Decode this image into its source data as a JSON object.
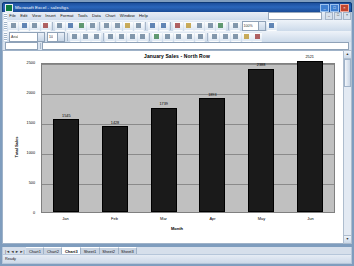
{
  "window": {
    "title": "Microsoft Excel - salesfigs",
    "icon": "excel-icon",
    "buttons": {
      "minimize": "_",
      "maximize": "□",
      "close": "×"
    }
  },
  "menu": {
    "items": [
      "File",
      "Edit",
      "View",
      "Insert",
      "Format",
      "Tools",
      "Data",
      "Chart",
      "Window",
      "Help"
    ],
    "question_placeholder": "Type a question for help"
  },
  "formula_bar": {
    "name_box": "",
    "formula": ""
  },
  "chart_data": {
    "type": "bar",
    "title": "January Sales - North Row",
    "xlabel": "Month",
    "ylabel": "Total Sales",
    "categories": [
      "Jan",
      "Feb",
      "Mar",
      "Apr",
      "May",
      "Jun"
    ],
    "values": [
      1545,
      1428,
      1739,
      1893,
      2388,
      2521
    ],
    "labels": [
      "1545",
      "1428",
      "1739",
      "1893",
      "2388",
      "2521"
    ],
    "yticks": [
      0,
      500,
      1000,
      1500,
      2000,
      2500
    ],
    "ytick_labels": [
      "0",
      "500",
      "1000",
      "1500",
      "2000",
      "2500"
    ],
    "ylim": [
      0,
      2500
    ],
    "grid": true,
    "legend": "none",
    "series_color": "#1a1a1a",
    "plot_background": "#c0c0c0"
  },
  "sheet_tabs": {
    "nav": [
      "|◄",
      "◄",
      "►",
      "►|"
    ],
    "tabs": [
      "Chart1",
      "Chart2",
      "Chart3",
      "Sheet1",
      "Sheet2",
      "Sheet3"
    ],
    "active_index": 2
  },
  "status_bar": {
    "text": "Ready"
  },
  "scrollbar": {
    "up": "▲",
    "down": "▼"
  }
}
